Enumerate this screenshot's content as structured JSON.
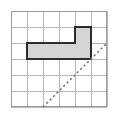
{
  "figure": {
    "background_color": "#ffffff",
    "width": 114,
    "height": 116
  },
  "grid": {
    "label": "six-by-six square grid",
    "columns": 6,
    "rows": 6,
    "cell_size": 16,
    "origin_x": 11,
    "origin_y": 11,
    "line_color": "#b8b8b8",
    "border_color": "#9a9a9a",
    "vertical_lines_x": [
      11,
      27,
      43,
      59,
      75,
      91,
      107
    ],
    "horizontal_lines_y": [
      11,
      27,
      43,
      59,
      75,
      91,
      107
    ]
  },
  "shape": {
    "label": "shaded L-shaped polygon",
    "fill_color": "#d5d5d5",
    "stroke_color": "#2b2b2b",
    "stroke_width": 2,
    "points": "27,43 75,43 75,27 91,27 91,59 27,59",
    "vertices": [
      {
        "x": 27,
        "y": 43
      },
      {
        "x": 75,
        "y": 43
      },
      {
        "x": 75,
        "y": 27
      },
      {
        "x": 91,
        "y": 27
      },
      {
        "x": 91,
        "y": 59
      },
      {
        "x": 27,
        "y": 59
      }
    ],
    "area_cells": 7
  },
  "diagonal": {
    "label": "dashed diagonal line",
    "color": "#7a7a7a",
    "dash_pattern": "2.2 2.6",
    "x1": 43,
    "y1": 107,
    "x2": 107,
    "y2": 43
  }
}
